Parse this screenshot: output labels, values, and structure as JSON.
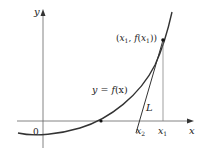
{
  "diagram": {
    "type": "newtons-method-tangent",
    "axes": {
      "x_label": "x",
      "y_label": "y",
      "origin_label": "0"
    },
    "curve": {
      "label_prefix": "y = ",
      "label_func": "f",
      "label_arg": "(x)"
    },
    "point": {
      "label_open": "(",
      "x_var": "x",
      "x_sub": "1",
      "sep": ", ",
      "func": "f",
      "arg_open": "(",
      "arg_var": "x",
      "arg_sub": "1",
      "close": "))"
    },
    "tangent_label": "L",
    "x_ticks": [
      {
        "var": "x",
        "sub": "2"
      },
      {
        "var": "x",
        "sub": "1"
      }
    ],
    "colors": {
      "ink": "#222222",
      "axis": "#555555",
      "background": "#ffffff"
    }
  }
}
